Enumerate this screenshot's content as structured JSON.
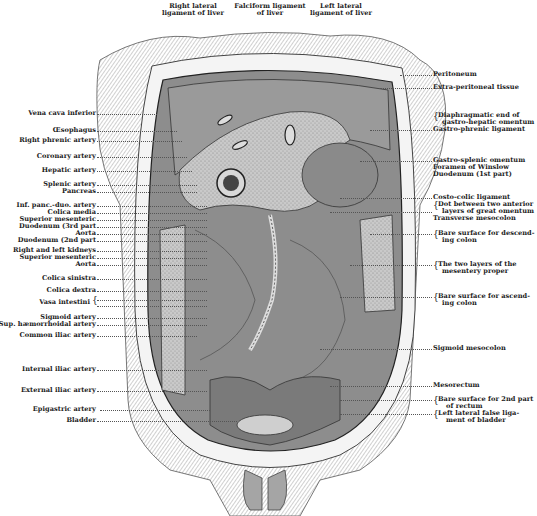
{
  "figure": {
    "top_labels": [
      {
        "text": "Right lateral\nligament of liver",
        "line1": "Right lateral",
        "line2": "ligament of liver"
      },
      {
        "text": "Falciform ligament\nof liver",
        "line1": "Falciform ligament",
        "line2": "of liver"
      },
      {
        "text": "Left lateral\nligament of liver",
        "line1": "Left lateral",
        "line2": "ligament of liver"
      }
    ],
    "left_labels": [
      "Vena cava inferior",
      "Œsophagus",
      "Right phrenic artery",
      "Coronary artery",
      "Hepatic artery",
      "Splenic artery",
      "Pancreas",
      "Inf. panc.-duo. artery",
      "Colica media",
      "Superior mesenteric",
      "Duodenum (3rd part",
      "Aorta",
      "Duodenum (2nd part",
      "Right and left kidneys",
      "Superior mesenteric",
      "Aorta",
      "Colica sinistra",
      "Colica dextra",
      "Vasa intestini",
      "Sigmoid artery",
      "Sup. hæmorrhoidal artery",
      "Common iliac artery",
      "Internal iliac artery",
      "External iliac artery",
      "Epigastric artery",
      "Bladder"
    ],
    "right_labels": [
      "Peritoneum",
      "Extra-peritoneal tissue",
      "Diaphragmatic end of",
      "gastro-hepatic omentum",
      "Gastro-phrenic ligament",
      "Gastro-splenic omentum",
      "Foramen of Winslow",
      "Duodenum (1st part)",
      "Costo-colic ligament",
      "Dot between two anterior",
      "layers of great omentum",
      "Transverse mesocolon",
      "Bare surface for descend-",
      "ing colon",
      "The two layers of the",
      "mesentery proper",
      "Bare surface for ascend-",
      "ing colon",
      "Sigmoid mesocolon",
      "Mesorectum",
      "Bare surface for 2nd part",
      "of rectum",
      "Left lateral false liga-",
      "ment of bladder"
    ]
  }
}
